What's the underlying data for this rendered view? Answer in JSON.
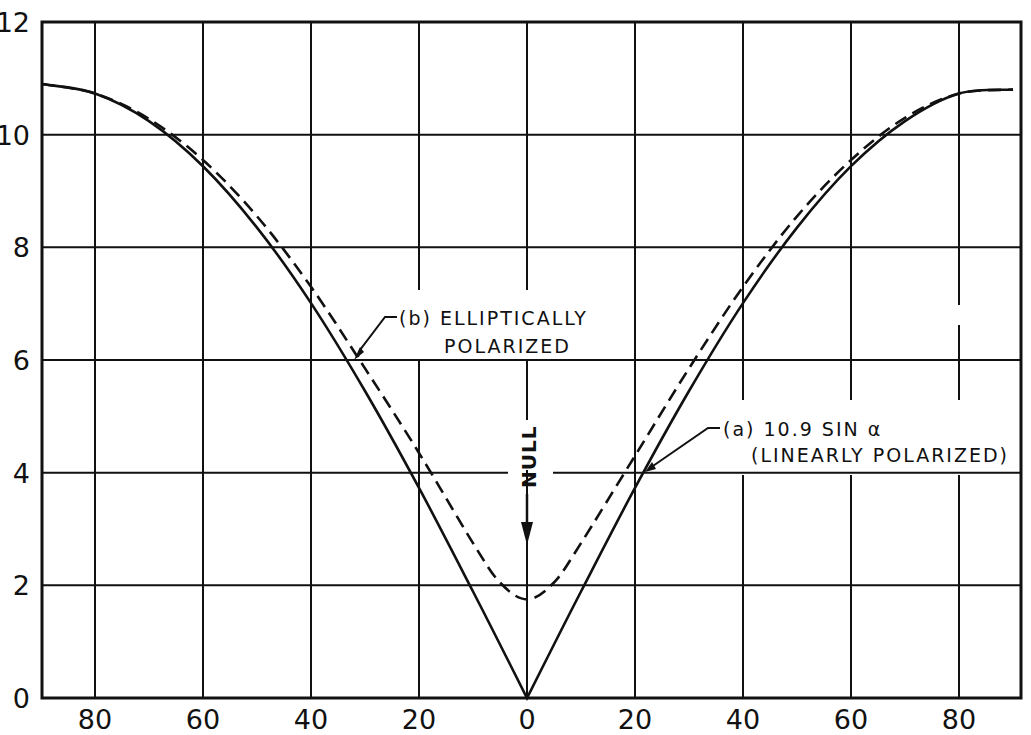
{
  "chart_data": {
    "type": "line",
    "title": "",
    "xlabel": "",
    "ylabel": "",
    "x_tick_labels": [
      "80",
      "60",
      "40",
      "20",
      "0",
      "20",
      "40",
      "60",
      "80"
    ],
    "x_ticks": [
      -80,
      -60,
      -40,
      -20,
      0,
      20,
      40,
      60,
      80
    ],
    "y_tick_labels": [
      "0",
      "2",
      "4",
      "6",
      "8",
      "10",
      "12"
    ],
    "y_ticks": [
      0,
      2,
      4,
      6,
      8,
      10,
      12
    ],
    "xlim": [
      -90,
      90
    ],
    "ylim": [
      0,
      12
    ],
    "grid": true,
    "x": [
      -90,
      -80,
      -70,
      -60,
      -50,
      -40,
      -30,
      -20,
      -10,
      -5,
      0,
      5,
      10,
      20,
      30,
      40,
      50,
      60,
      70,
      80,
      90
    ],
    "series": [
      {
        "name": "(a) 10.9 SIN α (LINEARLY POLARIZED)",
        "style": "solid",
        "values": [
          10.9,
          10.73,
          10.24,
          9.44,
          8.35,
          7.01,
          5.45,
          3.73,
          1.89,
          0.95,
          0,
          0.95,
          1.89,
          3.73,
          5.45,
          7.01,
          8.35,
          9.44,
          10.24,
          10.73,
          10.8
        ]
      },
      {
        "name": "(b) ELLIPTICALLY POLARIZED",
        "style": "dashed",
        "values": [
          10.9,
          10.73,
          10.28,
          9.55,
          8.55,
          7.3,
          5.85,
          4.35,
          2.75,
          2.05,
          1.75,
          2.05,
          2.75,
          4.3,
          5.85,
          7.3,
          8.55,
          9.55,
          10.3,
          10.73,
          10.8
        ]
      }
    ],
    "annotations": [
      {
        "text": "NULL",
        "x": 0,
        "y": 3,
        "arrow": "down",
        "rotated": true
      },
      {
        "text_line1": "(b) ELLIPTICALLY",
        "text_line2": "POLARIZED",
        "points_to_series": "(b)"
      },
      {
        "text_line1": "(a)  10.9 SIN α",
        "text_line2": "(LINEARLY POLARIZED)",
        "points_to_series": "(a)"
      }
    ]
  },
  "labels": {
    "null": "NULL",
    "b_line1": "(b) ELLIPTICALLY",
    "b_line2": "POLARIZED",
    "a_line1": "(a)  10.9 SIN α",
    "a_line2": "(LINEARLY POLARIZED)"
  }
}
